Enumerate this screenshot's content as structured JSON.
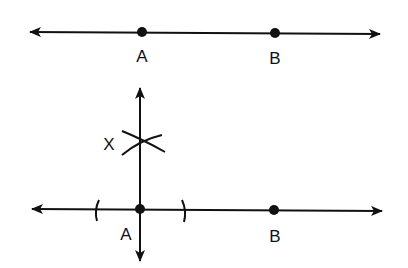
{
  "diagram": {
    "stroke_color": "#111111",
    "background": "#ffffff",
    "top_figure": {
      "line": {
        "x1": 26,
        "y1": 32,
        "x2": 384,
        "y2": 34,
        "arrows": "both"
      },
      "points": [
        {
          "label": "A",
          "x": 142,
          "y": 32,
          "label_x": 142,
          "label_y": 62
        },
        {
          "label": "B",
          "x": 275,
          "y": 33,
          "label_x": 275,
          "label_y": 64
        }
      ]
    },
    "bottom_figure": {
      "line": {
        "x1": 28,
        "y1": 209,
        "x2": 386,
        "y2": 211,
        "arrows": "both"
      },
      "perpendicular": {
        "x": 140,
        "y_top": 84,
        "y_bottom": 265,
        "arrows": "both"
      },
      "points": [
        {
          "label": "A",
          "x": 140,
          "y": 209,
          "label_x": 126,
          "label_y": 240
        },
        {
          "label": "B",
          "x": 274,
          "y": 210,
          "label_x": 275,
          "label_y": 242
        }
      ],
      "construction_mark": {
        "label": "X",
        "x": 140,
        "y": 143,
        "label_x": 109,
        "label_y": 150
      },
      "tick_arcs": [
        {
          "x": 97,
          "y": 210
        },
        {
          "x": 184,
          "y": 211
        }
      ]
    }
  },
  "labels": {
    "top_a": "A",
    "top_b": "B",
    "bottom_a": "A",
    "bottom_b": "B",
    "x_mark": "X"
  }
}
